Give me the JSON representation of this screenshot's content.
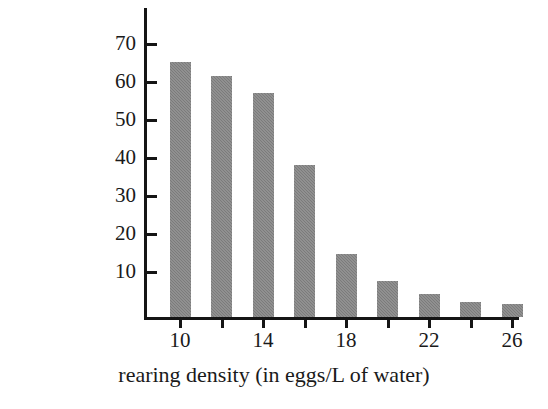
{
  "chart_data": {
    "type": "bar",
    "title": "",
    "xlabel": "rearing density (in eggs/L of water)",
    "ylabel": "percent survival at 4 weeks",
    "ylabel_lines": [
      "percent survival",
      "at 4 weeks"
    ],
    "categories": [
      10,
      12,
      14,
      16,
      18,
      20,
      22,
      24,
      26
    ],
    "values": [
      67,
      63.5,
      59,
      40,
      16.5,
      9.5,
      6,
      4,
      3.5
    ],
    "x": [
      10,
      12,
      14,
      16,
      18,
      20,
      22,
      24,
      26
    ],
    "xlim": [
      9,
      27
    ],
    "ylim": [
      0,
      78
    ],
    "xticks": [
      10,
      12,
      14,
      16,
      18,
      20,
      22,
      24,
      26
    ],
    "xtick_labels": [
      "10",
      "",
      "14",
      "",
      "18",
      "",
      "22",
      "",
      "26"
    ],
    "yticks": [
      10,
      20,
      30,
      40,
      50,
      60,
      70
    ],
    "ytick_labels": [
      "10",
      "20",
      "30",
      "40",
      "50",
      "60",
      "70"
    ],
    "grid": false,
    "legend": false,
    "legend_position": "none",
    "bar_color": "#7b7b7b",
    "axis_color": "#151515",
    "background_color": "#ffffff"
  }
}
